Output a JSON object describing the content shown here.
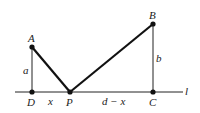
{
  "diagram": {
    "points": {
      "A": {
        "label": "A",
        "x": 32,
        "y": 47
      },
      "B": {
        "label": "B",
        "x": 153,
        "y": 24
      },
      "C": {
        "label": "C",
        "x": 153,
        "y": 92
      },
      "D": {
        "label": "D",
        "x": 32,
        "y": 92
      },
      "P": {
        "label": "P",
        "x": 70,
        "y": 92
      }
    },
    "segment_labels": {
      "a": "a",
      "b": "b",
      "x": "x",
      "d_minus_x": "d − x"
    },
    "line_label": "l",
    "colors": {
      "stroke": "#111111",
      "background": "#ffffff"
    }
  }
}
